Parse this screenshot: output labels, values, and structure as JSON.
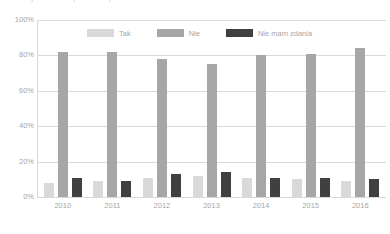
{
  "title_partial": "Wykres — opinie respondentów w latach 2010-2016",
  "chart_data": {
    "type": "bar",
    "title": "",
    "xlabel": "",
    "ylabel": "",
    "categories": [
      "2010",
      "2011",
      "2012",
      "2013",
      "2014",
      "2015",
      "2016"
    ],
    "series": [
      {
        "name": "Tak",
        "color": "#D9D9D9",
        "values": [
          8,
          9,
          11,
          12,
          11,
          10,
          9
        ]
      },
      {
        "name": "Nie",
        "color": "#A6A6A6",
        "values": [
          82,
          82,
          78,
          75,
          80,
          81,
          84
        ]
      },
      {
        "name": "Nie mam zdania",
        "color": "#404040",
        "values": [
          11,
          9,
          13,
          14,
          11,
          11,
          10
        ]
      }
    ],
    "ylim": [
      0,
      100
    ],
    "yticks": [
      "0%",
      "20%",
      "40%",
      "60%",
      "80%",
      "100%"
    ],
    "ytick_values": [
      0,
      20,
      40,
      60,
      80,
      100
    ],
    "grid": true,
    "legend_position": "top-inside"
  }
}
